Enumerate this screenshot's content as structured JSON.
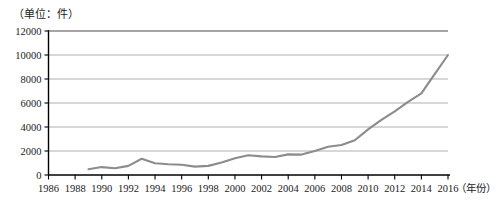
{
  "chart_data": {
    "type": "line",
    "title": "",
    "unit_label": "（单位：件）",
    "xlabel": "（年份）",
    "ylabel": "",
    "xlim": [
      1986,
      2016
    ],
    "ylim": [
      0,
      12000
    ],
    "grid": true,
    "legend": false,
    "line_color": "#8c8c8c",
    "axis_color": "#000000",
    "gridline_color": "#a6a6a6",
    "x_tick_labels": [
      "1986",
      "1988",
      "1990",
      "1992",
      "1994",
      "1996",
      "1998",
      "2000",
      "2002",
      "2004",
      "2006",
      "2008",
      "2010",
      "2012",
      "2014",
      "2016"
    ],
    "x_tick_values": [
      1986,
      1988,
      1990,
      1992,
      1994,
      1996,
      1998,
      2000,
      2002,
      2004,
      2006,
      2008,
      2010,
      2012,
      2014,
      2016
    ],
    "y_tick_labels": [
      "0",
      "2000",
      "4000",
      "6000",
      "8000",
      "10000",
      "12000"
    ],
    "y_tick_values": [
      0,
      2000,
      4000,
      6000,
      8000,
      10000,
      12000
    ],
    "series": [
      {
        "name": "件数",
        "x": [
          1989,
          1990,
          1991,
          1992,
          1993,
          1994,
          1995,
          1996,
          1997,
          1998,
          1999,
          2000,
          2001,
          2002,
          2003,
          2004,
          2005,
          2006,
          2007,
          2008,
          2009,
          2010,
          2011,
          2012,
          2013,
          2014,
          2015,
          2016
        ],
        "values": [
          480,
          660,
          560,
          760,
          1350,
          980,
          900,
          860,
          700,
          760,
          1050,
          1400,
          1650,
          1550,
          1500,
          1720,
          1700,
          2000,
          2350,
          2500,
          2900,
          3800,
          4600,
          5300,
          6100,
          6800,
          8400,
          10000
        ]
      }
    ]
  }
}
